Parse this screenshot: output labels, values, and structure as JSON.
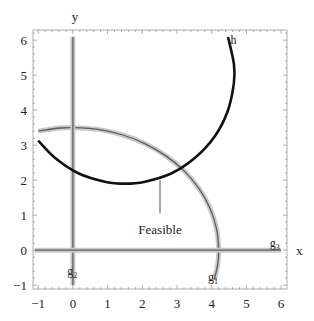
{
  "chart_data": {
    "type": "line",
    "title": "",
    "xlabel": "x",
    "ylabel": "y",
    "xlim": [
      -1.15,
      6.17
    ],
    "ylim": [
      -1.11,
      6.29
    ],
    "grid": false,
    "legend": "none (curves labeled inline)",
    "x_ticks": [
      -1,
      0,
      1,
      2,
      3,
      4,
      5,
      6
    ],
    "y_ticks": [
      -1,
      0,
      1,
      2,
      3,
      4,
      5,
      6
    ],
    "minor_tick_step": 0.2,
    "axis_label_positions": {
      "x": [
        6.52,
        -0.03
      ],
      "y": [
        0.06,
        6.66
      ]
    },
    "colors": {
      "frame": "#9a9a9a",
      "tick": "#8a8a8a",
      "constraint_band": "#c9c9c9",
      "constraint_line": "#5e5e5e",
      "equality_line": "#111111",
      "annotation": "#444444"
    },
    "series": [
      {
        "name": "g1",
        "label": {
          "text": "g",
          "sub": "1",
          "pos": [
            4.04,
            -0.88
          ]
        },
        "kind": "constraint",
        "points": [
          [
            -1.0,
            3.4
          ],
          [
            -0.37,
            3.49
          ],
          [
            0.0,
            3.5
          ],
          [
            0.73,
            3.45
          ],
          [
            1.44,
            3.29
          ],
          [
            2.1,
            3.03
          ],
          [
            2.7,
            2.68
          ],
          [
            3.22,
            2.25
          ],
          [
            3.64,
            1.75
          ],
          [
            3.95,
            1.2
          ],
          [
            4.14,
            0.61
          ],
          [
            4.2,
            0.0
          ],
          [
            4.17,
            -0.43
          ],
          [
            4.07,
            -0.85
          ]
        ]
      },
      {
        "name": "g2",
        "label": {
          "text": "g",
          "sub": "2",
          "pos": [
            -0.02,
            -0.7
          ]
        },
        "kind": "constraint",
        "points": [
          [
            0.0,
            -1.0
          ],
          [
            0.0,
            6.1
          ]
        ]
      },
      {
        "name": "g3",
        "label": {
          "text": "g",
          "sub": "3",
          "pos": [
            5.82,
            0.1
          ]
        },
        "kind": "constraint",
        "points": [
          [
            -1.1,
            0.0
          ],
          [
            6.0,
            0.0
          ]
        ]
      },
      {
        "name": "h",
        "label": {
          "text": "h",
          "sub": "",
          "pos": [
            4.63,
            5.9
          ]
        },
        "kind": "equality",
        "points": [
          [
            -1.0,
            3.13
          ],
          [
            -0.52,
            2.64
          ],
          [
            0.17,
            2.19
          ],
          [
            0.95,
            1.95
          ],
          [
            1.5,
            1.9
          ],
          [
            2.05,
            1.95
          ],
          [
            2.83,
            2.19
          ],
          [
            3.52,
            2.64
          ],
          [
            4.08,
            3.24
          ],
          [
            4.46,
            3.97
          ],
          [
            4.64,
            4.78
          ],
          [
            4.64,
            5.32
          ],
          [
            4.47,
            6.09
          ]
        ]
      }
    ],
    "annotations": [
      {
        "text": "Feasible",
        "text_pos": [
          2.51,
          0.58
        ],
        "pointer_from": [
          2.51,
          2.0
        ],
        "pointer_to": [
          2.51,
          1.05
        ]
      }
    ]
  }
}
